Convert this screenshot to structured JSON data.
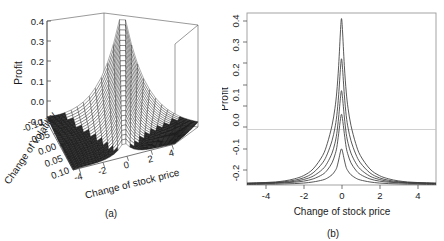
{
  "figure": {
    "background": "#ffffff",
    "ink_color": "#1a1a1a",
    "width": 444,
    "height": 241
  },
  "panel_a": {
    "caption": "(a)",
    "type": "surface3d",
    "z_axis": {
      "label": "Profit",
      "ticks": [
        "0.4",
        "0.3",
        "0.2",
        "0.1",
        "0.0",
        "-0.1"
      ],
      "values": [
        0.4,
        0.3,
        0.2,
        0.1,
        0.0,
        -0.1
      ]
    },
    "y_axis": {
      "label": "Change of volatility",
      "ticks": [
        "-0.10",
        "-0.05",
        "0.00",
        "0.05",
        "0.10"
      ],
      "values": [
        -0.1,
        -0.05,
        0.0,
        0.05,
        0.1
      ]
    },
    "x_axis": {
      "label": "Change of stock price",
      "ticks": [
        "-4",
        "-2",
        "0",
        "2",
        "4"
      ],
      "values": [
        -4,
        -2,
        0,
        2,
        4
      ]
    }
  },
  "panel_b": {
    "caption": "(b)",
    "x_axis": {
      "label": "Change of stock price",
      "ticks": [
        "-4",
        "-2",
        "0",
        "2",
        "4"
      ],
      "values": [
        -4,
        -2,
        0,
        2,
        4
      ]
    },
    "y_axis": {
      "label": "Profit",
      "ticks": [
        "0.4",
        "0.3",
        "0.2",
        "0.1",
        "0.0",
        "-0.1",
        "-0.2"
      ],
      "values": [
        0.4,
        0.3,
        0.2,
        0.1,
        0.0,
        -0.1,
        -0.2
      ]
    }
  },
  "chart_data": [
    {
      "type": "surface",
      "title": "",
      "panel": "(a)",
      "xlabel": "Change of stock price",
      "ylabel": "Change of volatility",
      "zlabel": "Profit",
      "xlim": [
        -5,
        5
      ],
      "ylim": [
        -0.1,
        0.1
      ],
      "zlim": [
        -0.2,
        0.4
      ],
      "xticks": [
        -4,
        -2,
        0,
        2,
        4
      ],
      "yticks": [
        -0.1,
        -0.05,
        0.0,
        0.05,
        0.1
      ],
      "zticks": [
        -0.1,
        0.0,
        0.1,
        0.2,
        0.3,
        0.4
      ],
      "grid": false,
      "legend": "none",
      "description": "Profit surface of an option strategy as a joint function of change of stock price and change of volatility; a steep ridge peaking near zero stock-price change, rising with volatility, flattening to a loss plateau in the tails.",
      "mesh_n_x": 25,
      "mesh_n_y": 25
    },
    {
      "type": "line",
      "title": "",
      "panel": "(b)",
      "xlabel": "Change of stock price",
      "ylabel": "Profit",
      "xlim": [
        -5,
        5
      ],
      "ylim": [
        -0.2,
        0.42
      ],
      "xticks": [
        -4,
        -2,
        0,
        2,
        4
      ],
      "yticks": [
        -0.2,
        -0.1,
        0.0,
        0.1,
        0.2,
        0.3,
        0.4
      ],
      "grid": false,
      "legend": "none",
      "zero_reference_line": 0.0,
      "x": [
        -5.0,
        -4.5,
        -4.0,
        -3.5,
        -3.0,
        -2.5,
        -2.0,
        -1.5,
        -1.0,
        -0.75,
        -0.5,
        -0.35,
        -0.25,
        -0.15,
        -0.05,
        0.0,
        0.05,
        0.15,
        0.25,
        0.35,
        0.5,
        0.75,
        1.0,
        1.5,
        2.0,
        2.5,
        3.0,
        3.5,
        4.0,
        4.5,
        5.0
      ],
      "series": [
        {
          "name": "volatility change +0.10",
          "peak": 0.4,
          "values": [
            -0.193,
            -0.192,
            -0.191,
            -0.189,
            -0.185,
            -0.178,
            -0.166,
            -0.142,
            -0.094,
            -0.05,
            0.015,
            0.075,
            0.135,
            0.23,
            0.36,
            0.4,
            0.36,
            0.23,
            0.135,
            0.075,
            0.015,
            -0.05,
            -0.094,
            -0.142,
            -0.166,
            -0.178,
            -0.185,
            -0.189,
            -0.191,
            -0.192,
            -0.193
          ]
        },
        {
          "name": "volatility change +0.05",
          "peak": 0.255,
          "values": [
            -0.194,
            -0.193,
            -0.192,
            -0.191,
            -0.188,
            -0.183,
            -0.174,
            -0.156,
            -0.12,
            -0.088,
            -0.04,
            0.005,
            0.05,
            0.125,
            0.225,
            0.255,
            0.225,
            0.125,
            0.05,
            0.005,
            -0.04,
            -0.088,
            -0.12,
            -0.156,
            -0.174,
            -0.183,
            -0.188,
            -0.191,
            -0.192,
            -0.193,
            -0.194
          ]
        },
        {
          "name": "volatility change 0.00",
          "peak": 0.14,
          "values": [
            -0.195,
            -0.194,
            -0.193,
            -0.192,
            -0.19,
            -0.187,
            -0.18,
            -0.168,
            -0.143,
            -0.12,
            -0.085,
            -0.05,
            -0.015,
            0.045,
            0.118,
            0.14,
            0.118,
            0.045,
            -0.015,
            -0.05,
            -0.085,
            -0.12,
            -0.143,
            -0.168,
            -0.18,
            -0.187,
            -0.19,
            -0.192,
            -0.193,
            -0.194,
            -0.195
          ]
        },
        {
          "name": "volatility change -0.05",
          "peak": 0.055,
          "values": [
            -0.196,
            -0.195,
            -0.195,
            -0.194,
            -0.192,
            -0.19,
            -0.186,
            -0.178,
            -0.162,
            -0.146,
            -0.12,
            -0.092,
            -0.065,
            -0.015,
            0.04,
            0.055,
            0.04,
            -0.015,
            -0.065,
            -0.092,
            -0.12,
            -0.146,
            -0.162,
            -0.178,
            -0.186,
            -0.19,
            -0.192,
            -0.194,
            -0.195,
            -0.195,
            -0.196
          ]
        },
        {
          "name": "volatility change -0.10",
          "peak": -0.07,
          "values": [
            -0.198,
            -0.198,
            -0.197,
            -0.197,
            -0.196,
            -0.195,
            -0.193,
            -0.189,
            -0.182,
            -0.175,
            -0.163,
            -0.15,
            -0.137,
            -0.11,
            -0.078,
            -0.07,
            -0.078,
            -0.11,
            -0.137,
            -0.15,
            -0.163,
            -0.175,
            -0.182,
            -0.189,
            -0.193,
            -0.195,
            -0.196,
            -0.197,
            -0.197,
            -0.198,
            -0.198
          ]
        }
      ]
    }
  ]
}
